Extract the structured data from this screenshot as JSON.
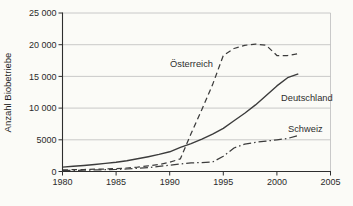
{
  "colors": {
    "background": "#fbfbf7",
    "line": "#3c3c3c",
    "grid": "#bcbcbc",
    "axis": "#2e2e2e",
    "text": "#1f1f1f"
  },
  "chart_data": {
    "type": "line",
    "title": "",
    "xlabel": "",
    "ylabel": "Anzahl Biobetriebe",
    "xlim": [
      1980,
      2005
    ],
    "ylim": [
      0,
      25000
    ],
    "grid": "horizontal",
    "legend_position": "inline-annotations",
    "x_ticks": [
      1980,
      1985,
      1990,
      1995,
      2000,
      2005
    ],
    "x_tick_labels": [
      "1980",
      "1985",
      "1990",
      "1995",
      "2000",
      "2005"
    ],
    "y_ticks": [
      0,
      5000,
      10000,
      15000,
      20000,
      25000
    ],
    "y_tick_labels": [
      "0",
      "5000",
      "10 000",
      "15 000",
      "20 000",
      "25 000"
    ],
    "x": [
      1980,
      1981,
      1982,
      1983,
      1984,
      1985,
      1986,
      1987,
      1988,
      1989,
      1990,
      1991,
      1992,
      1993,
      1994,
      1995,
      1996,
      1997,
      1998,
      1999,
      2000,
      2001,
      2002
    ],
    "series": [
      {
        "name": "Österreich",
        "line_style": "dashed",
        "values": [
          250,
          280,
          320,
          360,
          400,
          450,
          550,
          700,
          900,
          1100,
          1450,
          2000,
          6000,
          9800,
          13700,
          18300,
          19400,
          19900,
          20100,
          19900,
          18300,
          18300,
          18600
        ]
      },
      {
        "name": "Deutschland",
        "line_style": "solid",
        "values": [
          700,
          820,
          950,
          1100,
          1270,
          1450,
          1700,
          2000,
          2330,
          2700,
          3100,
          3800,
          4400,
          5100,
          5900,
          6800,
          8000,
          9200,
          10500,
          12000,
          13500,
          14800,
          15400
        ]
      },
      {
        "name": "Schweiz",
        "line_style": "dash-dot",
        "values": [
          150,
          180,
          210,
          250,
          280,
          320,
          400,
          500,
          620,
          800,
          1000,
          1200,
          1350,
          1400,
          1500,
          2400,
          3700,
          4300,
          4600,
          4800,
          5000,
          5200,
          5700
        ]
      }
    ]
  }
}
